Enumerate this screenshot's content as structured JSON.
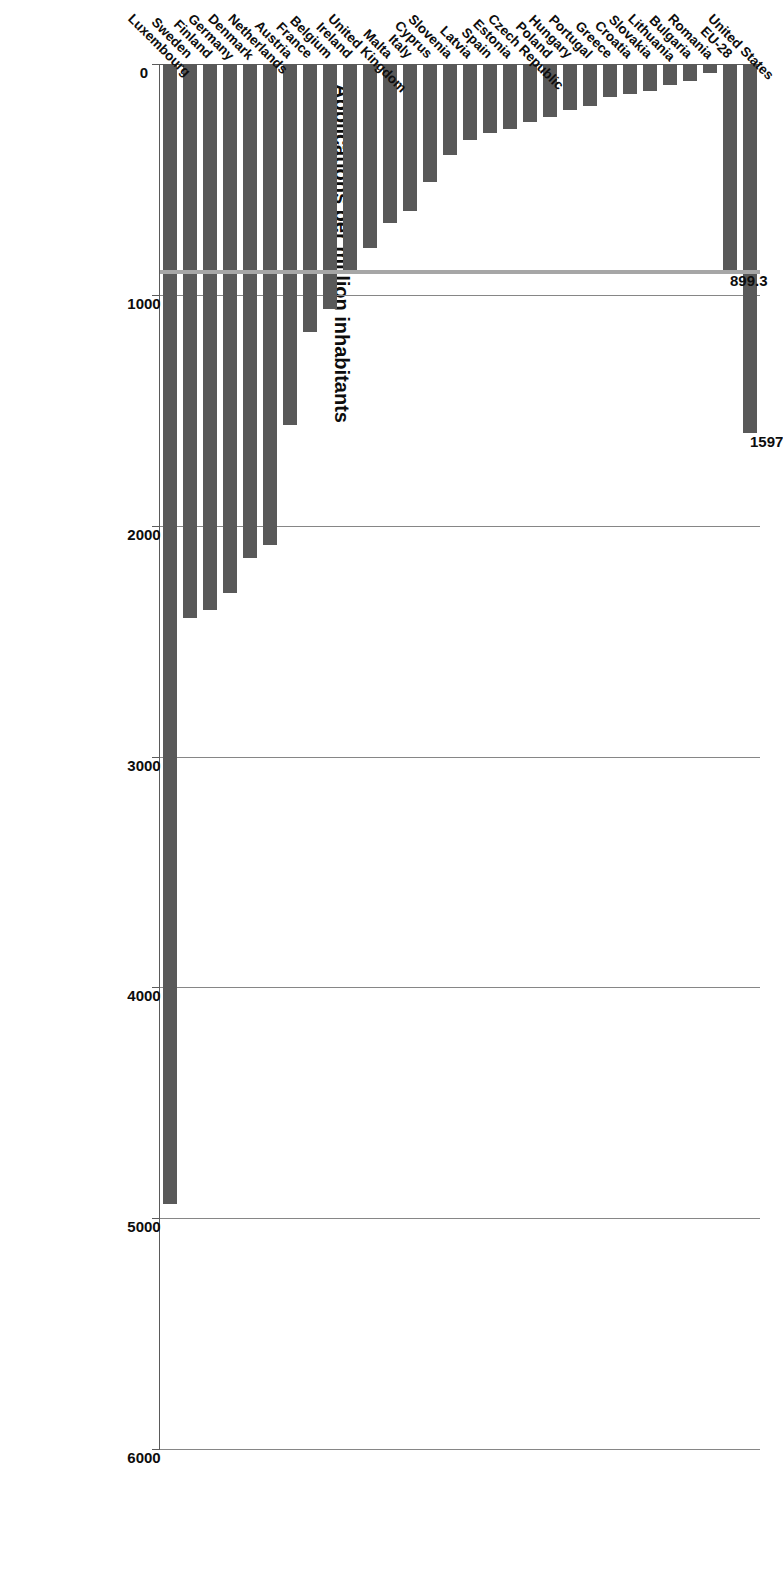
{
  "chart_data": {
    "type": "bar",
    "orientation": "vertical-bars-rotated",
    "title": "Applications per million inhabitants",
    "xlabel": "",
    "ylabel": "",
    "ylim": [
      0,
      6000
    ],
    "grid": true,
    "legend": null,
    "tick_labels": [
      "0",
      "1000",
      "2000",
      "3000",
      "4000",
      "5000",
      "6000"
    ],
    "tick_values": [
      0,
      1000,
      2000,
      3000,
      4000,
      5000,
      6000
    ],
    "categories": [
      "Luxembourg",
      "Sweden",
      "Finland",
      "Germany",
      "Denmark",
      "Netherlands",
      "Austria",
      "France",
      "Belgium",
      "Ireland",
      "United Kingdom",
      "Malta",
      "Italy",
      "Cyprus",
      "Slovenia",
      "Latvia",
      "Spain",
      "Estonia",
      "Czech Republic",
      "Poland",
      "Hungary",
      "Portugal",
      "Greece",
      "Croatia",
      "Slovakia",
      "Lithuania",
      "Bulgaria",
      "Romania",
      "EU-28",
      "United States"
    ],
    "values": [
      4939,
      2400,
      2365,
      2290,
      2140,
      2085,
      1565,
      1160,
      1060,
      910,
      795,
      690,
      635,
      510,
      395,
      330,
      300,
      280,
      250,
      230,
      200,
      180,
      145,
      130,
      115,
      90,
      75,
      40,
      899.3,
      1597
    ],
    "annotations": [
      {
        "category": "EU-28",
        "label": "899.3"
      },
      {
        "category": "United States",
        "label": "1597"
      }
    ],
    "reference_line": {
      "value": 899.3,
      "color": "#a6a6a6"
    },
    "bar_color": "#595959",
    "gridline_color": "#868686"
  }
}
